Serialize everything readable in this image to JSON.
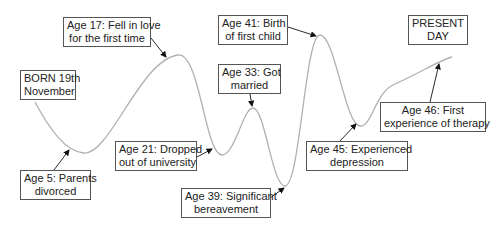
{
  "colors": {
    "curve": "#b0b0b0",
    "arrow": "#111111",
    "box_border": "#555555",
    "text": "#222222"
  },
  "events": [
    {
      "id": "born",
      "line1": "BORN 19th",
      "line2": "November",
      "age": 0
    },
    {
      "id": "age5",
      "line1": "Age 5: Parents",
      "line2": "divorced",
      "age": 5
    },
    {
      "id": "age17",
      "line1": "Age 17: Fell in love",
      "line2": "for the first time",
      "age": 17
    },
    {
      "id": "age21",
      "line1": "Age 21: Dropped",
      "line2": "out of university",
      "age": 21
    },
    {
      "id": "age33",
      "line1": "Age 33: Got",
      "line2": "married",
      "age": 33
    },
    {
      "id": "age39",
      "line1": "Age 39: Significant",
      "line2": "bereavement",
      "age": 39
    },
    {
      "id": "age41",
      "line1": "Age 41: Birth",
      "line2": "of first child",
      "age": 41
    },
    {
      "id": "age45",
      "line1": "Age 45: Experienced",
      "line2": "depression",
      "age": 45
    },
    {
      "id": "age46",
      "line1": "Age 46: First",
      "line2": "experience of therapy",
      "age": 46
    },
    {
      "id": "present",
      "line1": "PRESENT",
      "line2": "DAY"
    }
  ]
}
